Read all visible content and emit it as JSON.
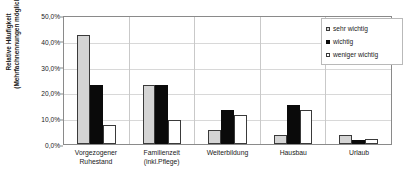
{
  "chart_data": {
    "type": "bar",
    "title": "",
    "xlabel": "",
    "ylabel_line1": "Relative Häufigkeit",
    "ylabel_line2": "(Mehrfachnennungen möglich)",
    "categories": [
      [
        "Vorgezogener",
        "Ruhestand"
      ],
      [
        "Familienzeit",
        "(inkl.Pflege)"
      ],
      [
        "Weiterbildung"
      ],
      [
        "Hausbau"
      ],
      [
        "Urlaub"
      ]
    ],
    "series": [
      {
        "name": "sehr wichtig",
        "color": "#d4d4d4",
        "values": [
          42.2,
          22.8,
          5.6,
          3.5,
          3.4
        ]
      },
      {
        "name": "wichtig",
        "color": "#0a0a0a",
        "values": [
          23.0,
          22.9,
          13.0,
          15.1,
          1.7
        ]
      },
      {
        "name": "weniger wichtig",
        "color": "#ffffff",
        "values": [
          7.3,
          9.4,
          11.2,
          13.0,
          1.8
        ]
      }
    ],
    "ylim": [
      0,
      50
    ],
    "ytick_values": [
      0,
      10,
      20,
      30,
      40,
      50
    ],
    "ytick_labels": [
      "0,0%",
      "10,0%",
      "20,0%",
      "30,0%",
      "40,0%",
      "50,0%"
    ],
    "grid": "horizontal",
    "legend_position": "top-right"
  }
}
